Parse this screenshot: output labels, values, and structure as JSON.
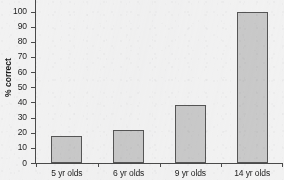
{
  "chart_data": {
    "type": "bar",
    "title": "",
    "xlabel": "",
    "ylabel": "% correct",
    "categories": [
      "5 yr olds",
      "6 yr olds",
      "9 yr olds",
      "14 yr olds"
    ],
    "values": [
      18,
      22,
      38,
      100
    ],
    "ylim": [
      0,
      100
    ],
    "ytick_labels": [
      "0",
      "10",
      "20",
      "30",
      "40",
      "50",
      "60",
      "70",
      "80",
      "90",
      "100"
    ],
    "ytick_values": [
      0,
      10,
      20,
      30,
      40,
      50,
      60,
      70,
      80,
      90,
      100
    ],
    "grid": false,
    "legend": false,
    "colors": {
      "bar_fill": "#c9c9c9",
      "bar_border": "#555555",
      "axis": "#4a4a4a",
      "text": "#1d1d1d",
      "background": "#f2f2f2"
    }
  }
}
